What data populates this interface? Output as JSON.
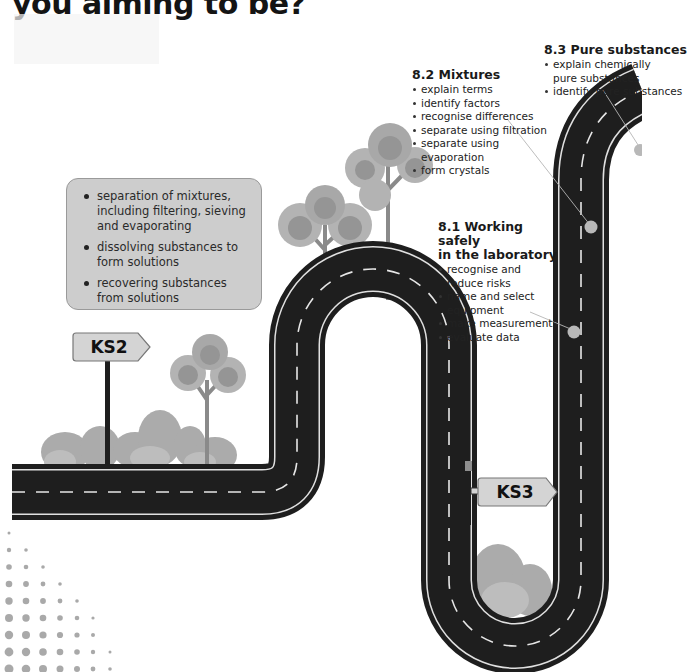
{
  "heading": {
    "text": "you aiming to be?"
  },
  "ks2_box": {
    "items": [
      "separation of mixtures, including filtering, sieving and evaporating",
      "dissolving substances to form solutions",
      "recovering substances from solutions"
    ]
  },
  "signs": {
    "ks2": "KS2",
    "ks3": "KS3"
  },
  "topics": [
    {
      "title": "8.1 Working safely in the laboratory",
      "title_lines": [
        "8.1 Working safely",
        "in the laboratory"
      ],
      "items": [
        "recognise and reduce risks",
        "name and select equipment",
        "make measurements",
        "evaluate data"
      ]
    },
    {
      "title": "8.2 Mixtures",
      "items": [
        "explain terms",
        "identify factors",
        "recognise differences",
        "separate using filtration",
        "separate using evaporation",
        "form crystals"
      ]
    },
    {
      "title": "8.3 Pure substances",
      "items": [
        "explain chemically pure substances",
        "identify pure substances"
      ]
    }
  ],
  "colors": {
    "road": "#1e1e1e",
    "road_line": "#e6e6e6",
    "box": "#cdcdcd",
    "tree": "#9a9a9a",
    "bush": "#a6a6a6",
    "dot": "#a9a9a9",
    "sign": "#d4d4d4"
  }
}
